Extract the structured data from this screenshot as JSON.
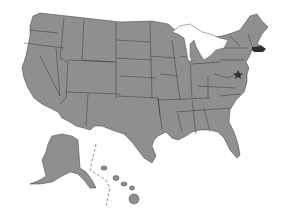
{
  "map": {
    "title": "United States",
    "base_color": "#8f8f8f",
    "border_color": "#3a3a3a",
    "highlight_color": "#2e2e2e",
    "highlighted_states": [
      "Massachusetts"
    ],
    "markers": [
      {
        "type": "star",
        "location": "Washington, D.C.",
        "color": "#2e2e2e"
      }
    ],
    "insets": [
      "Alaska",
      "Hawaii"
    ]
  }
}
